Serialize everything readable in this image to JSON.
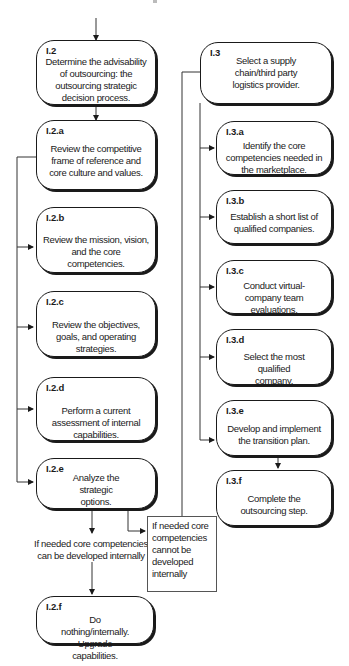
{
  "diagram": {
    "type": "flowchart",
    "left_column": [
      {
        "id": "I.2",
        "text": "Determine the advisability of outsourcing: the outsourcing strategic decision process."
      },
      {
        "id": "I.2.a",
        "text": "Review the competitive frame of reference and core culture and values."
      },
      {
        "id": "I.2.b",
        "text": "Review the mission, vision, and the core competencies."
      },
      {
        "id": "I.2.c",
        "text": "Review the objectives, goals, and operating strategies."
      },
      {
        "id": "I.2.d",
        "text": "Perform a current assessment of internal capabilities."
      },
      {
        "id": "I.2.e",
        "text": "Analyze the strategic options."
      },
      {
        "id": "I.2.f",
        "text": "Do nothing/internally. Upgrade capabilities."
      }
    ],
    "right_column": [
      {
        "id": "I.3",
        "text": "Select a supply chain/third party logistics provider."
      },
      {
        "id": "I.3.a",
        "text": "Identify the core competencies needed in the marketplace."
      },
      {
        "id": "I.3.b",
        "text": "Establish a short list of qualified companies."
      },
      {
        "id": "I.3.c",
        "text": "Conduct virtual-company team evaluations."
      },
      {
        "id": "I.3.d",
        "text": "Select the most qualified company."
      },
      {
        "id": "I.3.e",
        "text": "Develop and implement the transition plan."
      },
      {
        "id": "I.3.f",
        "text": "Complete the outsourcing step."
      }
    ],
    "conditions": {
      "internal": "If needed core competencies can be developed internally",
      "external": "If needed core competencies cannot be developed internally"
    },
    "edges": [
      [
        "start",
        "I.2"
      ],
      [
        "I.2",
        "I.2.a"
      ],
      [
        "I.2.a",
        "I.2.b"
      ],
      [
        "I.2.a",
        "I.2.c"
      ],
      [
        "I.2.a",
        "I.2.d"
      ],
      [
        "I.2.a",
        "I.2.e"
      ],
      [
        "I.2.e",
        "internal"
      ],
      [
        "internal",
        "I.2.f"
      ],
      [
        "I.2.e",
        "external"
      ],
      [
        "external",
        "I.3"
      ],
      [
        "I.3",
        "I.3.a"
      ],
      [
        "I.3",
        "I.3.b"
      ],
      [
        "I.3",
        "I.3.c"
      ],
      [
        "I.3",
        "I.3.d"
      ],
      [
        "I.3",
        "I.3.e"
      ],
      [
        "I.3.e",
        "I.3.f"
      ]
    ],
    "colors": {
      "stroke": "#1a1a1a",
      "note_border": "#555555",
      "background": "#ffffff"
    }
  }
}
